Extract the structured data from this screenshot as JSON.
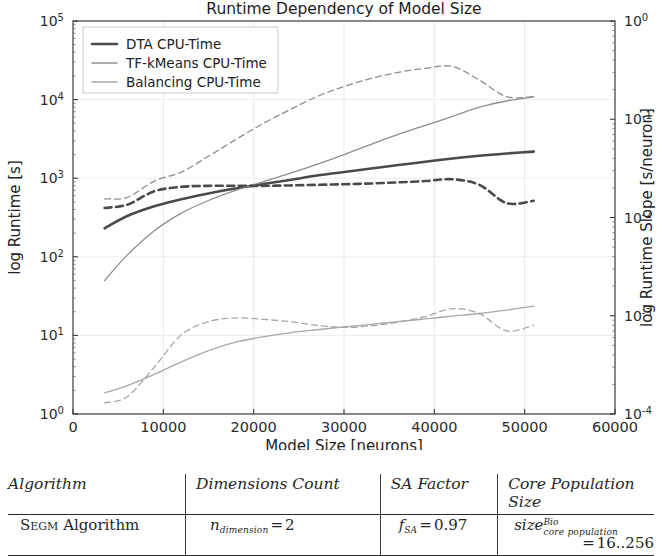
{
  "chart_data": {
    "type": "line",
    "title": "Runtime Dependency of Model Size",
    "xlabel": "Model Size [neurons]",
    "ylabel": "log Runtime [s]",
    "y2label": "log Runtime Slope [s/neuron]",
    "xlim": [
      0,
      60000
    ],
    "xticks": [
      0,
      10000,
      20000,
      30000,
      40000,
      50000,
      60000
    ],
    "xticklabels": [
      "0",
      "10000",
      "20000",
      "30000",
      "40000",
      "50000",
      "60000"
    ],
    "yscale": "log",
    "ylim": [
      1,
      100000
    ],
    "yticks": [
      1,
      10,
      100,
      1000,
      10000,
      100000
    ],
    "yticklabels": [
      "10^0",
      "10^1",
      "10^2",
      "10^3",
      "10^4",
      "10^5"
    ],
    "y2scale": "log",
    "y2lim": [
      0.0001,
      1
    ],
    "y2ticks": [
      0.0001,
      0.001,
      0.01,
      0.1,
      1
    ],
    "y2ticklabels": [
      "10^-4",
      "10^-3",
      "10^-2",
      "10^-1",
      "10^0"
    ],
    "grid": true,
    "legend_position": "upper left",
    "legend_entries": [
      "DTA CPU-Time",
      "TF-kMeans CPU-Time",
      "Balancing CPU-Time"
    ],
    "x": [
      3500,
      6000,
      9000,
      12000,
      15000,
      18000,
      21000,
      24000,
      27000,
      30000,
      33000,
      36000,
      39000,
      42000,
      45000,
      48000,
      51000
    ],
    "series": [
      {
        "name": "DTA CPU-Time",
        "axis": "left",
        "style": "solid",
        "color": "#4a4a4a",
        "values": [
          230,
          330,
          440,
          540,
          640,
          740,
          840,
          950,
          1080,
          1200,
          1330,
          1470,
          1620,
          1780,
          1930,
          2060,
          2180
        ]
      },
      {
        "name": "TF-kMeans CPU-Time",
        "axis": "left",
        "style": "solid",
        "color": "#8e8e8e",
        "values": [
          50,
          105,
          215,
          360,
          520,
          700,
          900,
          1150,
          1500,
          2000,
          2700,
          3600,
          4700,
          6100,
          8000,
          9600,
          10800
        ]
      },
      {
        "name": "Balancing CPU-Time",
        "axis": "left",
        "style": "solid",
        "color": "#a8a8a8",
        "values": [
          1.85,
          2.3,
          3.2,
          4.6,
          6.4,
          8.2,
          9.6,
          10.8,
          11.8,
          12.8,
          13.8,
          15.0,
          16.2,
          17.6,
          19.0,
          21.0,
          23.5
        ]
      },
      {
        "name": "DTA Slope",
        "axis": "right",
        "style": "dashed",
        "color": "#4a4a4a",
        "values": [
          0.0125,
          0.0135,
          0.0185,
          0.0205,
          0.021,
          0.021,
          0.021,
          0.0212,
          0.0215,
          0.0218,
          0.0222,
          0.0228,
          0.0235,
          0.0245,
          0.0215,
          0.014,
          0.0148
        ]
      },
      {
        "name": "TF-kMeans Slope",
        "axis": "right",
        "style": "dashed",
        "color": "#8e8e8e",
        "values": [
          0.0155,
          0.016,
          0.0235,
          0.029,
          0.042,
          0.062,
          0.09,
          0.125,
          0.17,
          0.215,
          0.26,
          0.3,
          0.33,
          0.345,
          0.25,
          0.17,
          0.17
        ]
      },
      {
        "name": "Balancing Slope",
        "axis": "right",
        "style": "dashed",
        "color": "#a8a8a8",
        "values": [
          0.00013,
          0.00015,
          0.0003,
          0.00064,
          0.00087,
          0.00095,
          0.00092,
          0.00087,
          0.0008,
          0.00076,
          0.00079,
          0.00086,
          0.00098,
          0.00118,
          0.00105,
          0.0007,
          0.0008
        ]
      }
    ]
  },
  "table": {
    "headers": [
      "Algorithm",
      "Dimensions Count",
      "SA Factor",
      "Core Population Size"
    ],
    "row": {
      "algorithm_caps": "Segm",
      "algorithm_rest": " Algorithm",
      "dimensions_symbol": "n",
      "dimensions_sub": "dimension",
      "dimensions_eq": "=",
      "dimensions_value": "2",
      "sa_symbol": "f",
      "sa_sub": "SA",
      "sa_eq": "=",
      "sa_value": "0.97",
      "core_symbol": "size",
      "core_sup": "Bio",
      "core_sub": "core population",
      "core_eq": "=",
      "core_value": "16..256"
    }
  }
}
